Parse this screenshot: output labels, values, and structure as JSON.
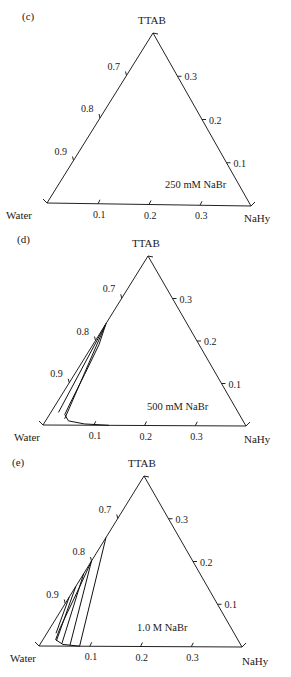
{
  "header": {
    "fragment_text": "cut-off running header"
  },
  "chart_data": [
    {
      "type": "ternary",
      "panel": "(c)",
      "title": "250 mM NaBr",
      "vertices": {
        "top": "TTAB",
        "left": "Water",
        "right": "NaHy"
      },
      "visible_range": {
        "water": [
          0.6,
          1.0
        ],
        "ttab": [
          0.0,
          0.4
        ],
        "nahy": [
          0.0,
          0.4
        ]
      },
      "axes": {
        "left_ticks": [
          "0.7",
          "0.8",
          "0.9"
        ],
        "bottom_ticks": [
          "0.1",
          "0.2",
          "0.3"
        ],
        "right_ticks": [
          "0.3",
          "0.2",
          "0.1"
        ]
      },
      "phase_boundary": [],
      "tie_lines": []
    },
    {
      "type": "ternary",
      "panel": "(d)",
      "title": "500 mM NaBr",
      "vertices": {
        "top": "TTAB",
        "left": "Water",
        "right": "NaHy"
      },
      "visible_range": {
        "water": [
          0.6,
          1.0
        ],
        "ttab": [
          0.0,
          0.4
        ],
        "nahy": [
          0.0,
          0.4
        ]
      },
      "axes": {
        "left_ticks": [
          "0.7",
          "0.8",
          "0.9"
        ],
        "bottom_ticks": [
          "0.1",
          "0.2",
          "0.3"
        ],
        "right_ticks": [
          "0.3",
          "0.2",
          "0.1"
        ]
      },
      "phase_boundary_note": "two-phase region along Water–TTAB edge, curving along Water–NaHy edge to ~0.13 NaHy",
      "phase_boundary": [
        {
          "nahy": 0.0,
          "ttab": 0.24
        },
        {
          "nahy": 0.012,
          "ttab": 0.19
        },
        {
          "nahy": 0.02,
          "ttab": 0.12
        },
        {
          "nahy": 0.027,
          "ttab": 0.05
        },
        {
          "nahy": 0.03,
          "ttab": 0.025
        },
        {
          "nahy": 0.045,
          "ttab": 0.01
        },
        {
          "nahy": 0.08,
          "ttab": 0.003
        },
        {
          "nahy": 0.13,
          "ttab": 0.0
        }
      ],
      "tie_lines": [
        {
          "from": {
            "nahy": 0.0,
            "ttab": 0.24
          },
          "to": {
            "nahy": 0.015,
            "ttab": 0.03
          }
        },
        {
          "from": {
            "nahy": 0.0,
            "ttab": 0.24
          },
          "to": {
            "nahy": 0.035,
            "ttab": 0.015
          }
        }
      ]
    },
    {
      "type": "ternary",
      "panel": "(e)",
      "title": "1.0 M NaBr",
      "vertices": {
        "top": "TTAB",
        "left": "Water",
        "right": "NaHy"
      },
      "visible_range": {
        "water": [
          0.6,
          1.0
        ],
        "ttab": [
          0.0,
          0.4
        ],
        "nahy": [
          0.0,
          0.4
        ]
      },
      "axes": {
        "left_ticks": [
          "0.7",
          "0.8",
          "0.9"
        ],
        "bottom_ticks": [
          "0.1",
          "0.2",
          "0.3"
        ],
        "right_ticks": [
          "0.3",
          "0.2",
          "0.1"
        ]
      },
      "phase_boundary": [
        {
          "nahy": 0.0,
          "ttab": 0.2
        },
        {
          "nahy": 0.008,
          "ttab": 0.14
        },
        {
          "nahy": 0.015,
          "ttab": 0.08
        },
        {
          "nahy": 0.02,
          "ttab": 0.04
        },
        {
          "nahy": 0.025,
          "ttab": 0.015
        },
        {
          "nahy": 0.045,
          "ttab": 0.004
        },
        {
          "nahy": 0.08,
          "ttab": 0.0
        }
      ],
      "tie_lines": [
        {
          "from": {
            "nahy": 0.0,
            "ttab": 0.255
          },
          "to": {
            "nahy": 0.08,
            "ttab": 0.0
          }
        },
        {
          "from": {
            "nahy": 0.0,
            "ttab": 0.2
          },
          "to": {
            "nahy": 0.06,
            "ttab": 0.002
          }
        },
        {
          "from": {
            "nahy": 0.0,
            "ttab": 0.17
          },
          "to": {
            "nahy": 0.042,
            "ttab": 0.006
          }
        },
        {
          "from": {
            "nahy": 0.0,
            "ttab": 0.14
          },
          "to": {
            "nahy": 0.028,
            "ttab": 0.012
          }
        },
        {
          "from": {
            "nahy": 0.0,
            "ttab": 0.115
          },
          "to": {
            "nahy": 0.018,
            "ttab": 0.03
          }
        }
      ]
    }
  ]
}
